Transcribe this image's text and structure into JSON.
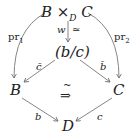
{
  "diagram": {
    "nodes": {
      "top": {
        "base": "B ×",
        "sub": "D",
        "tail": " C"
      },
      "mid": "(b/c)",
      "left": "B",
      "right": "C",
      "bottom": "D"
    },
    "arrows": {
      "w": "w",
      "w_equiv": "≃",
      "pr1": {
        "base": "pr",
        "sub": "1"
      },
      "pr2": {
        "base": "pr",
        "sub": "2"
      },
      "cbar": "c̄",
      "bbar": "b̄",
      "b": "b",
      "c": "c",
      "center_tilde": "~",
      "center_arrow": "⇒"
    }
  }
}
